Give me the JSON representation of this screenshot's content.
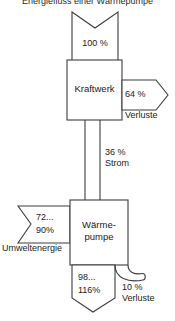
{
  "diagram": {
    "title": "Energiefluss einer Wärmepumpe",
    "type": "sankey-energy-flow",
    "background_color": "#ffffff",
    "line_color": "#3d3d3d",
    "nodes": [
      {
        "id": "kraftwerk",
        "label": "Kraftwerk",
        "shape": "rectangle"
      },
      {
        "id": "waermepumpe",
        "label_line1": "Wärme-",
        "label_line2": "pumpe",
        "shape": "rectangle"
      }
    ],
    "flows": [
      {
        "id": "input-primary",
        "value_label": "100 %",
        "direction": "down",
        "shape": "notched-band",
        "target": "kraftwerk"
      },
      {
        "id": "kraftwerk-losses",
        "value_label": "64 %",
        "caption": "Verluste",
        "direction": "right",
        "shape": "arrow-pentagon",
        "source": "kraftwerk"
      },
      {
        "id": "strom",
        "value_label": "36 %",
        "caption": "Strom",
        "direction": "down",
        "shape": "narrow-band",
        "source": "kraftwerk",
        "target": "waermepumpe"
      },
      {
        "id": "umweltenergie",
        "value_line1": "72...",
        "value_line2": "90%",
        "caption": "Umweltenergie",
        "direction": "right",
        "shape": "banner-notched",
        "target": "waermepumpe"
      },
      {
        "id": "nutzwaerme",
        "value_line1": "98...",
        "value_line2": "116%",
        "direction": "down",
        "shape": "arrow-down",
        "source": "waermepumpe"
      },
      {
        "id": "pumpe-losses",
        "value_label": "10 %",
        "caption": "Verluste",
        "direction": "right-curved",
        "shape": "hook-curve",
        "source": "waermepumpe"
      }
    ]
  }
}
